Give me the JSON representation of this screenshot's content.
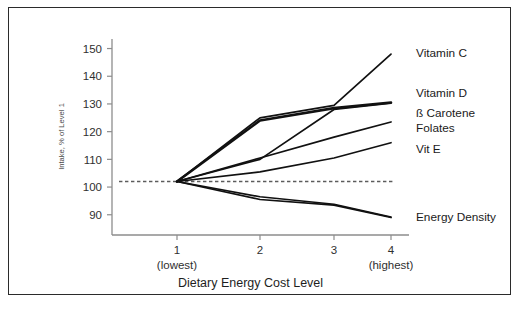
{
  "figure": {
    "background": "#ffffff",
    "border_color": "#2b2b2b"
  },
  "chart_data": {
    "type": "line",
    "title": "",
    "xlabel": "Dietary Energy Cost Level",
    "ylabel": "Intake, % of Level 1",
    "x": [
      1,
      2,
      3,
      4
    ],
    "xtick_labels": [
      "1",
      "2",
      "3",
      "4"
    ],
    "xtick_sublabels": [
      "(lowest)",
      "",
      "",
      "(highest)"
    ],
    "xlim": [
      0.62,
      4.32
    ],
    "ylim": [
      84.5,
      152
    ],
    "ytick_labels": [
      "150",
      "140",
      "130",
      "120",
      "110",
      "100",
      "90"
    ],
    "yticks": [
      150,
      140,
      130,
      120,
      110,
      100,
      90
    ],
    "grid": false,
    "legend_position": "right-of-line-ends",
    "reference_line": {
      "value": 102,
      "style": "dashed",
      "color": "#5c5c5c",
      "x_start": 1.0,
      "x_end": 4.05
    },
    "series": [
      {
        "name": "Vitamin C",
        "label": "Vitamin C",
        "values": [
          102,
          125,
          129.5,
          148
        ],
        "color": "#111111",
        "width": "normal",
        "label_y": 148
      },
      {
        "name": "Vitamin D",
        "label": "Vitamin D",
        "values": [
          102,
          124,
          128.5,
          130.5
        ],
        "color": "#111111",
        "width": "thick",
        "label_y": 133.5
      },
      {
        "name": "Beta Carotene",
        "label": "ß Carotene",
        "values": [
          102,
          110,
          128,
          130.3
        ],
        "color": "#111111",
        "width": "normal",
        "label_y": 126.5
      },
      {
        "name": "Folates",
        "label": "Folates",
        "values": [
          102,
          110.5,
          118,
          123.5
        ],
        "color": "#111111",
        "width": "normal",
        "label_y": 121
      },
      {
        "name": "Vit E",
        "label": "Vit E",
        "values": [
          102,
          105.5,
          110.5,
          116
        ],
        "color": "#111111",
        "width": "normal",
        "label_y": 113.5
      },
      {
        "name": "Energy Density",
        "label": "Energy Density",
        "values": [
          102,
          95.5,
          93.5,
          89
        ],
        "color": "#111111",
        "width": "normal",
        "label_y": 89
      },
      {
        "name": "Energy Density Second",
        "label": "",
        "values": [
          102,
          96.5,
          93.8,
          89.2
        ],
        "color": "#111111",
        "width": "normal",
        "label_y": null
      }
    ]
  }
}
